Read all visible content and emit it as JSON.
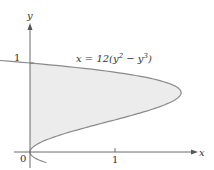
{
  "chart_data": {
    "type": "area",
    "title": "",
    "equation_label": "x = 12(y² − y³)",
    "equation_parts": {
      "lhs": "x = 12(y",
      "exp1": "2",
      "mid": " − y",
      "exp2": "3",
      "rhs": ")"
    },
    "xlabel": "x",
    "ylabel": "y",
    "x_ticks": [
      {
        "value": 1,
        "label": "1"
      }
    ],
    "y_ticks": [
      {
        "value": 1,
        "label": "1"
      }
    ],
    "origin_label": "0",
    "xlim": [
      -0.19,
      1.95
    ],
    "ylim": [
      -0.2,
      1.45
    ],
    "curve": {
      "function": "x = 12(y^2 - y^3)",
      "y_range": [
        0,
        1
      ],
      "max_x": 1.78,
      "max_at_y": 0.667
    },
    "shaded_region": "region bounded by curve and y-axis for 0 <= y <= 1",
    "colors": {
      "fill": "#ececec",
      "curve": "#8a8a8a",
      "axis": "#6a6a6a"
    },
    "grid": false
  }
}
